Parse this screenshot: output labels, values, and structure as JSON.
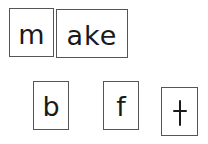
{
  "word_tiles": [
    {
      "id": "onset",
      "text": "m"
    },
    {
      "id": "rime",
      "text": "ake"
    }
  ],
  "letter_choices": [
    {
      "id": "choice-1",
      "text": "b"
    },
    {
      "id": "choice-2",
      "text": "f"
    },
    {
      "id": "choice-3",
      "text": "t"
    }
  ]
}
